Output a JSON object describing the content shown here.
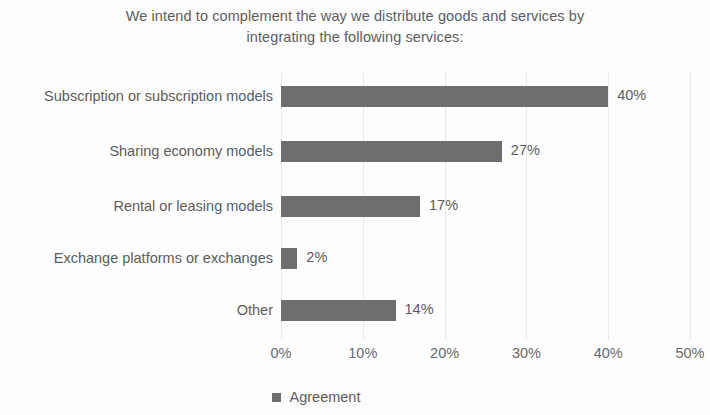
{
  "chart_data": {
    "type": "bar",
    "orientation": "horizontal",
    "title": "We intend to complement the way we distribute goods and services by integrating the following services:",
    "xlabel": "",
    "ylabel": "",
    "categories": [
      "Subscription or subscription models",
      "Sharing economy models",
      "Rental or leasing models",
      "Exchange platforms or exchanges",
      "Other"
    ],
    "values": [
      40,
      27,
      17,
      2,
      14
    ],
    "value_labels": [
      "40%",
      "27%",
      "17%",
      "2%",
      "14%"
    ],
    "series": [
      {
        "name": "Agreement",
        "values": [
          40,
          27,
          17,
          2,
          14
        ],
        "color": "#6e6e6e"
      }
    ],
    "xlim": [
      0,
      50
    ],
    "xticks": [
      0,
      10,
      20,
      30,
      40,
      50
    ],
    "xtick_labels": [
      "0%",
      "10%",
      "20%",
      "30%",
      "40%",
      "50%"
    ],
    "grid": true,
    "grid_axis": "x",
    "grid_color": "#e9e9e9",
    "legend": {
      "position": "bottom",
      "entries": [
        {
          "label": "Agreement",
          "color": "#6e6e6e"
        }
      ]
    },
    "background_color": "#fdfdfd",
    "text_color": "#5c5c5c"
  }
}
